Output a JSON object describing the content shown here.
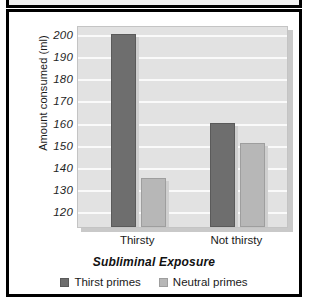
{
  "chart_data": {
    "type": "bar",
    "title": "",
    "xlabel": "Subliminal Exposure",
    "ylabel": "Amount consumed (ml)",
    "categories": [
      "Thirsty",
      "Not thirsty"
    ],
    "series": [
      {
        "name": "Thirst primes",
        "color": "#6e6e6e",
        "values": [
          200,
          160
        ]
      },
      {
        "name": "Neutral primes",
        "color": "#b7b7b7",
        "values": [
          135,
          151
        ]
      }
    ],
    "ylim": [
      113,
      204
    ],
    "yticks": [
      200,
      190,
      180,
      170,
      160,
      150,
      140,
      130,
      120
    ],
    "grid": true,
    "legend_position": "bottom",
    "plot_background": "#e2e2e2",
    "gridline_color": "#fafafa",
    "frame_color": "#000000"
  }
}
